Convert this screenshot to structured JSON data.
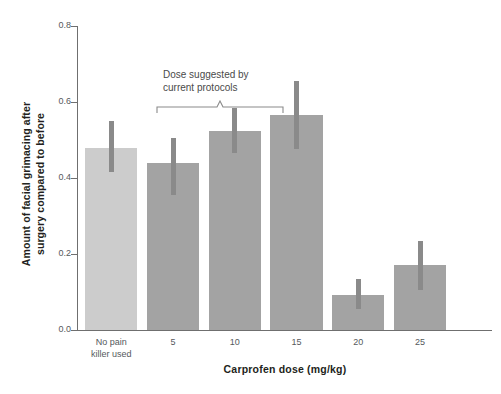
{
  "chart_data": {
    "type": "bar",
    "title": "",
    "xlabel": "Carprofen dose (mg/kg)",
    "ylabel": "Amount of facial grimacing after surgery compared to before",
    "ylabel_line1": "Amount of facial grimacing after",
    "ylabel_line2": "surgery compared to before",
    "categories": [
      "No pain killer used",
      "5",
      "10",
      "15",
      "20",
      "25"
    ],
    "category_lines": [
      [
        "No pain",
        "killer used"
      ],
      [
        "5"
      ],
      [
        "10"
      ],
      [
        "15"
      ],
      [
        "20"
      ],
      [
        "25"
      ]
    ],
    "values": [
      0.48,
      0.44,
      0.525,
      0.565,
      0.093,
      0.17
    ],
    "error_low": [
      0.415,
      0.355,
      0.465,
      0.475,
      0.055,
      0.105
    ],
    "error_high": [
      0.55,
      0.505,
      0.585,
      0.655,
      0.135,
      0.235
    ],
    "ylim": [
      0.0,
      0.8
    ],
    "yticks": [
      0.0,
      0.2,
      0.4,
      0.6,
      0.8
    ],
    "ytick_labels": [
      "0.0",
      "0.2",
      "0.4",
      "0.6",
      "0.8"
    ],
    "grid": false,
    "legend": "none",
    "bar_colors": [
      "#cccccc",
      "#a3a3a3",
      "#a3a3a3",
      "#a3a3a3",
      "#a3a3a3",
      "#a3a3a3"
    ],
    "error_color": "#8a8a8a",
    "axis_color": "#6f6f6f",
    "annotations": [
      {
        "text": "Dose suggested by current protocols",
        "line1": "Dose suggested by",
        "line2": "current protocols",
        "covers": [
          "5",
          "10"
        ]
      }
    ]
  }
}
